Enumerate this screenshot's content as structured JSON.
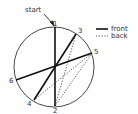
{
  "diagram": {
    "start_label": "start",
    "point_labels": [
      "1",
      "2",
      "3",
      "4",
      "5",
      "6"
    ],
    "legend": [
      {
        "style": "solid",
        "label": "front"
      },
      {
        "style": "dotted",
        "label": "back"
      }
    ],
    "colors": {
      "line": "#1a1a1a",
      "circle": "#333333",
      "text": "#333333"
    }
  }
}
